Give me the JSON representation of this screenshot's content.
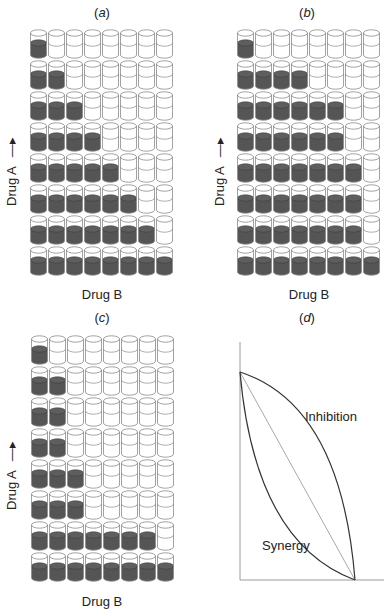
{
  "figure": {
    "colors": {
      "filled": "#555555",
      "outline": "#8a8a8a",
      "text": "#222222",
      "reference_line": "#9a9a9a"
    }
  },
  "panels": [
    {
      "id": "a",
      "title_open": "(",
      "title_letter": "a",
      "title_close": ")",
      "xlabel": "Drug B",
      "ylabel": "Drug A",
      "ylabel_arrow": "→",
      "filled_per_row_top_to_bottom": [
        1,
        2,
        3,
        4,
        5,
        6,
        7,
        8
      ]
    },
    {
      "id": "b",
      "title_open": "(",
      "title_letter": "b",
      "title_close": ")",
      "xlabel": "Drug B",
      "ylabel": "Drug A",
      "ylabel_arrow": "→",
      "filled_per_row_top_to_bottom": [
        1,
        4,
        6,
        6,
        7,
        7,
        7,
        8
      ]
    },
    {
      "id": "c",
      "title_open": "(",
      "title_letter": "c",
      "title_close": ")",
      "xlabel": "Drug B",
      "ylabel": "Drug A",
      "ylabel_arrow": "→",
      "filled_per_row_top_to_bottom": [
        1,
        2,
        2,
        2,
        3,
        3,
        7,
        8
      ]
    },
    {
      "id": "d",
      "title_open": "(",
      "title_letter": "d",
      "title_close": ")",
      "inhibition_label": "Inhibition",
      "synergy_label": "Synergy"
    }
  ],
  "grid": {
    "rows": 8,
    "cols": 8
  },
  "chart_data": {
    "type": "line",
    "title": "(d)",
    "xlabel": "",
    "ylabel": "",
    "series": [
      {
        "name": "Inhibition",
        "shape": "convex curve above diagonal",
        "points": [
          [
            0,
            1
          ],
          [
            1,
            0
          ]
        ]
      },
      {
        "name": "Additive (reference)",
        "shape": "straight diagonal",
        "points": [
          [
            0,
            1
          ],
          [
            1,
            0
          ]
        ]
      },
      {
        "name": "Synergy",
        "shape": "concave curve below diagonal",
        "points": [
          [
            0,
            1
          ],
          [
            1,
            0
          ]
        ]
      }
    ],
    "annotations": [
      "Inhibition",
      "Synergy"
    ]
  }
}
